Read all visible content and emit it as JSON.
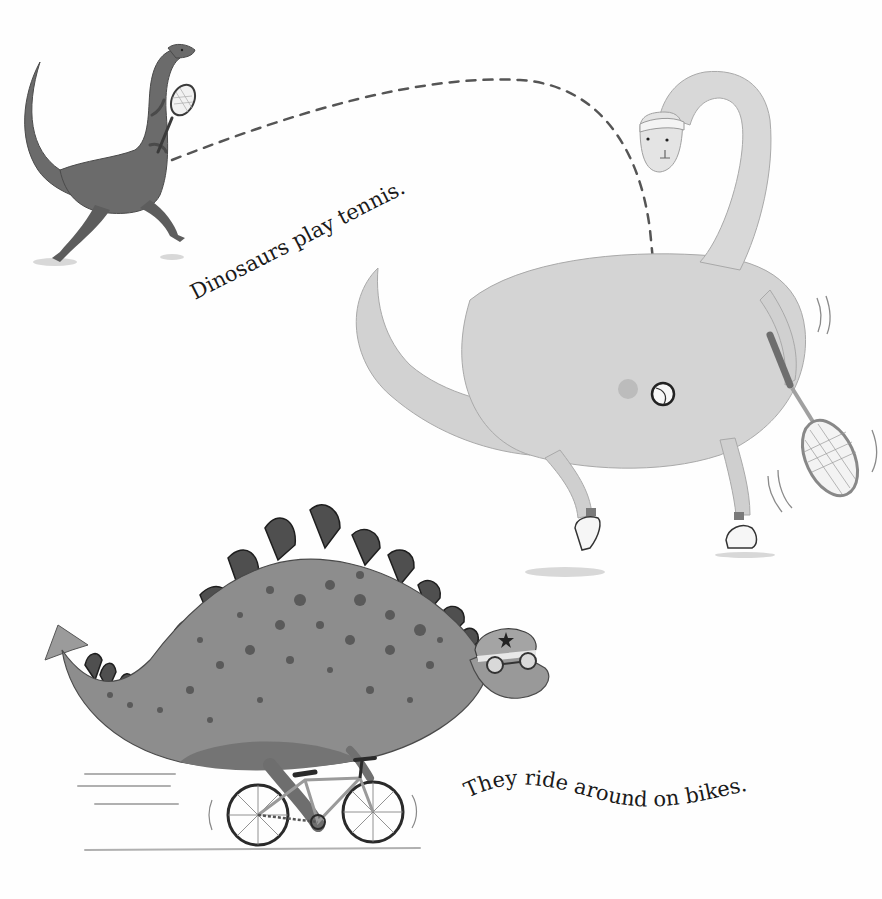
{
  "page": {
    "background": "#fefefe",
    "ink_color": "#1a1a1a"
  },
  "captions": {
    "tennis": "Dinosaurs play tennis.",
    "bikes": "They ride around on bikes."
  },
  "illustrations": [
    {
      "id": "small-dinosaur",
      "description": "dark grey dinosaur swinging a tennis racket"
    },
    {
      "id": "brachiosaurus",
      "description": "large light grey long-necked dinosaur with headband, racket and sneakers"
    },
    {
      "id": "tennis-ball",
      "description": "tennis ball at end of dashed trajectory"
    },
    {
      "id": "stegosaurus",
      "description": "spotted stegosaurus with star helmet and goggles riding a bicycle"
    }
  ],
  "colors": {
    "small_dino": "#6b6b6b",
    "small_dino_dark": "#4a4a4a",
    "brachio": "#d2d2d2",
    "brachio_shade": "#b8b8b8",
    "stego": "#8d8d8d",
    "stego_plates": "#4f4f4f",
    "spots": "#5a5a5a",
    "dash": "#555555"
  }
}
